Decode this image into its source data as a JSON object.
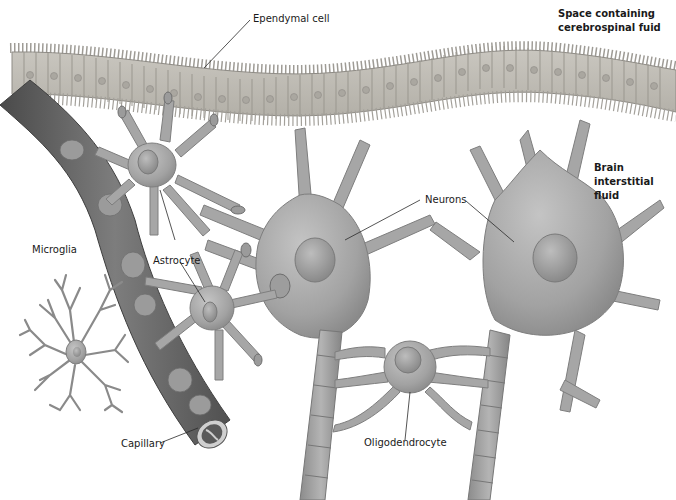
{
  "diagram": {
    "background_color": "#ffffff",
    "tissue_color": "#a8a8a8",
    "capillary_color": "#6a6a6a",
    "labels": {
      "ependymal_cell": "Ependymal cell",
      "csf_space": [
        "Space containing",
        "cerebrospinal fuid"
      ],
      "brain_interstitial_fluid": [
        "Brain",
        "interstitial",
        "fluid"
      ],
      "neurons": "Neurons",
      "microglia": "Microglia",
      "astrocyte": "Astrocyte",
      "capillary": "Capillary",
      "oligodendrocyte": "Oligodendrocyte"
    },
    "structures": [
      {
        "name": "ependymal-layer",
        "label": "Ependymal cell"
      },
      {
        "name": "capillary",
        "label": "Capillary"
      },
      {
        "name": "astrocyte-upper",
        "label": "Astrocyte"
      },
      {
        "name": "astrocyte-lower",
        "label": "Astrocyte"
      },
      {
        "name": "microglia",
        "label": "Microglia"
      },
      {
        "name": "neuron-left",
        "label": "Neurons"
      },
      {
        "name": "neuron-right",
        "label": "Neurons"
      },
      {
        "name": "oligodendrocyte",
        "label": "Oligodendrocyte"
      }
    ]
  }
}
